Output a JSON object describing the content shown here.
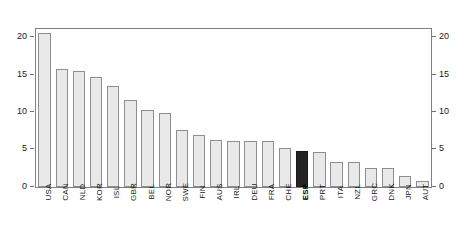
{
  "chart_data": {
    "type": "bar",
    "title": "",
    "subtitle": "",
    "xlabel": "",
    "ylabel": "",
    "ylim": [
      0,
      21.2
    ],
    "yticks": [
      0,
      5,
      10,
      15,
      20
    ],
    "ytick_labels": [
      "0",
      "5",
      "10",
      "15",
      "20"
    ],
    "grid": false,
    "legend": null,
    "axis_right_mirrored": true,
    "axis_right_tick_labels": [
      "0",
      "5",
      "10",
      "15",
      "20"
    ],
    "xtick_rotation": 90,
    "highlight_category": "ESP",
    "colors": {
      "bar_fill": "#e9e9e9",
      "bar_border": "#8e8e8e",
      "highlight_fill": "#242424",
      "highlight_border": "#1a1a1a",
      "frame": "#808080",
      "text": "#1a1a1a",
      "background": "#ffffff"
    },
    "categories": [
      "USA",
      "CAN",
      "NLD",
      "KOR",
      "ISL",
      "GBR",
      "BEL",
      "NOR",
      "SWE",
      "FIN",
      "AUS",
      "IRL",
      "DEU",
      "FRA",
      "CHE",
      "ESP",
      "PRT",
      "ITA",
      "NZL",
      "GRC",
      "DNK",
      "JPN",
      "AUT"
    ],
    "values": [
      20.7,
      15.8,
      15.5,
      14.7,
      13.6,
      11.7,
      10.4,
      9.9,
      7.6,
      7.0,
      6.3,
      6.2,
      6.2,
      6.2,
      5.3,
      4.8,
      4.7,
      3.4,
      3.3,
      2.6,
      2.5,
      1.5,
      0.8
    ]
  }
}
